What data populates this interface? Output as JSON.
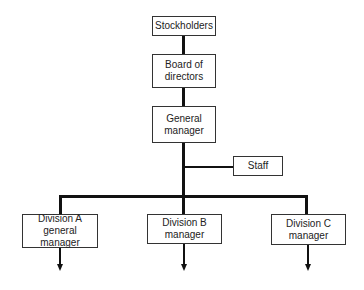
{
  "diagram": {
    "type": "organizational-chart",
    "nodes": {
      "stockholders": {
        "lines": [
          "Stockholders"
        ]
      },
      "board": {
        "lines": [
          "Board of",
          "directors"
        ]
      },
      "general_manager": {
        "lines": [
          "General",
          "manager"
        ]
      },
      "staff": {
        "lines": [
          "Staff"
        ]
      },
      "division_a": {
        "lines": [
          "Division A",
          "general manager"
        ]
      },
      "division_b": {
        "lines": [
          "Division B",
          "manager"
        ]
      },
      "division_c": {
        "lines": [
          "Division C",
          "manager"
        ]
      }
    },
    "edges": [
      [
        "stockholders",
        "board"
      ],
      [
        "board",
        "general_manager"
      ],
      [
        "general_manager",
        "staff"
      ],
      [
        "general_manager",
        "division_a"
      ],
      [
        "general_manager",
        "division_b"
      ],
      [
        "general_manager",
        "division_c"
      ]
    ],
    "colors": {
      "line": "#111111",
      "border": "#333333",
      "background": "#ffffff"
    }
  }
}
